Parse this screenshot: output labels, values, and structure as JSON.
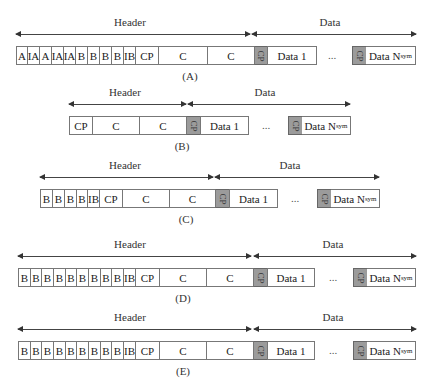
{
  "labels": {
    "header": "Header",
    "data": "Data",
    "cp": "CP",
    "dots": "...",
    "data1": "Data 1",
    "data_nsym": "Data N",
    "nsym_sub": "sym"
  },
  "frames": [
    {
      "id": "A",
      "caption": "(A)",
      "y": 22,
      "header_arrow": [
        16,
        250
      ],
      "data_arrow": [
        252,
        416
      ],
      "header_label_x": 130,
      "data_label_x": 330,
      "caption_x": 190,
      "cells": [
        {
          "t": "A",
          "w": 11
        },
        {
          "t": "IA",
          "w": 12
        },
        {
          "t": "A",
          "w": 12
        },
        {
          "t": "IA",
          "w": 12
        },
        {
          "t": "IA",
          "w": 12
        },
        {
          "t": "B",
          "w": 12
        },
        {
          "t": "B",
          "w": 12
        },
        {
          "t": "B",
          "w": 12
        },
        {
          "t": "B",
          "w": 12
        },
        {
          "t": "IB",
          "w": 12
        },
        {
          "t": "CP",
          "w": 23
        },
        {
          "t": "C",
          "w": 49
        },
        {
          "t": "C",
          "w": 47
        },
        {
          "t": "CP",
          "w": 13,
          "gray": true
        },
        {
          "t": "Data 1",
          "w": 49
        }
      ],
      "start_x": 16,
      "tail": {
        "dots_x": 332,
        "gray_x": 352,
        "nsym_w": 49
      }
    },
    {
      "id": "B",
      "caption": "(B)",
      "y": 92,
      "header_arrow": [
        69,
        186
      ],
      "data_arrow": [
        188,
        350
      ],
      "header_label_x": 125,
      "data_label_x": 265,
      "caption_x": 182,
      "cells": [
        {
          "t": "CP",
          "w": 23
        },
        {
          "t": "C",
          "w": 47
        },
        {
          "t": "C",
          "w": 47
        },
        {
          "t": "CP",
          "w": 14,
          "gray": true
        },
        {
          "t": "Data 1",
          "w": 48
        }
      ],
      "start_x": 69,
      "tail": {
        "dots_x": 266,
        "gray_x": 288,
        "nsym_w": 48
      }
    },
    {
      "id": "C",
      "caption": "(C)",
      "y": 165,
      "header_arrow": [
        40,
        213
      ],
      "data_arrow": [
        215,
        379
      ],
      "header_label_x": 125,
      "data_label_x": 290,
      "caption_x": 186,
      "cells": [
        {
          "t": "B",
          "w": 12
        },
        {
          "t": "B",
          "w": 12
        },
        {
          "t": "B",
          "w": 12
        },
        {
          "t": "B",
          "w": 11
        },
        {
          "t": "IB",
          "w": 12
        },
        {
          "t": "CP",
          "w": 23
        },
        {
          "t": "C",
          "w": 47
        },
        {
          "t": "C",
          "w": 46
        },
        {
          "t": "CP",
          "w": 14,
          "gray": true
        },
        {
          "t": "Data 1",
          "w": 48
        }
      ],
      "start_x": 40,
      "tail": {
        "dots_x": 295,
        "gray_x": 317,
        "nsym_w": 48
      }
    },
    {
      "id": "D",
      "caption": "(D)",
      "y": 244,
      "header_arrow": [
        18,
        251
      ],
      "data_arrow": [
        254,
        416
      ],
      "header_label_x": 130,
      "data_label_x": 333,
      "caption_x": 183,
      "cells": [
        {
          "t": "B",
          "w": 12
        },
        {
          "t": "B",
          "w": 11
        },
        {
          "t": "B",
          "w": 12
        },
        {
          "t": "B",
          "w": 12
        },
        {
          "t": "B",
          "w": 11
        },
        {
          "t": "B",
          "w": 12
        },
        {
          "t": "B",
          "w": 12
        },
        {
          "t": "B",
          "w": 11
        },
        {
          "t": "B",
          "w": 12
        },
        {
          "t": "IB",
          "w": 12
        },
        {
          "t": "CP",
          "w": 24
        },
        {
          "t": "C",
          "w": 47
        },
        {
          "t": "C",
          "w": 47
        },
        {
          "t": "CP",
          "w": 14,
          "gray": true
        },
        {
          "t": "Data 1",
          "w": 47
        }
      ],
      "start_x": 18,
      "tail": {
        "dots_x": 333,
        "gray_x": 353,
        "nsym_w": 48
      }
    },
    {
      "id": "E",
      "caption": "(E)",
      "y": 317,
      "header_arrow": [
        18,
        251
      ],
      "data_arrow": [
        254,
        416
      ],
      "header_label_x": 130,
      "data_label_x": 333,
      "caption_x": 183,
      "cells": [
        {
          "t": "B",
          "w": 12
        },
        {
          "t": "B",
          "w": 11
        },
        {
          "t": "B",
          "w": 12
        },
        {
          "t": "B",
          "w": 12
        },
        {
          "t": "B",
          "w": 11
        },
        {
          "t": "B",
          "w": 12
        },
        {
          "t": "B",
          "w": 12
        },
        {
          "t": "B",
          "w": 11
        },
        {
          "t": "B",
          "w": 12
        },
        {
          "t": "IB",
          "w": 12
        },
        {
          "t": "CP",
          "w": 24
        },
        {
          "t": "C",
          "w": 47
        },
        {
          "t": "C",
          "w": 47
        },
        {
          "t": "CP",
          "w": 14,
          "gray": true
        },
        {
          "t": "Data 1",
          "w": 47
        }
      ],
      "start_x": 18,
      "tail": {
        "dots_x": 333,
        "gray_x": 353,
        "nsym_w": 48
      }
    }
  ]
}
